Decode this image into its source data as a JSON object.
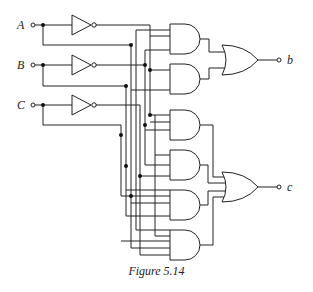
{
  "figure": {
    "caption": "Figure 5.14",
    "inputs": [
      {
        "label": "A"
      },
      {
        "label": "B"
      },
      {
        "label": "C"
      }
    ],
    "outputs": [
      {
        "label": "b"
      },
      {
        "label": "c"
      }
    ],
    "components": {
      "inverters": 3,
      "and_gates": 6,
      "or_gates": 2
    },
    "colors": {
      "line": "#222222",
      "background": "#ffffff"
    }
  }
}
